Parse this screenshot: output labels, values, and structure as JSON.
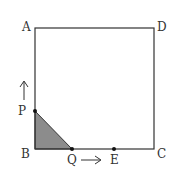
{
  "diagram": {
    "points": {
      "A": {
        "label": "A",
        "x": 35,
        "y": 28
      },
      "B": {
        "label": "B",
        "x": 35,
        "y": 149
      },
      "C": {
        "label": "C",
        "x": 154,
        "y": 149
      },
      "D": {
        "label": "D",
        "x": 154,
        "y": 28
      },
      "P": {
        "label": "P",
        "x": 35,
        "y": 111
      },
      "Q": {
        "label": "Q",
        "x": 72,
        "y": 149
      },
      "E": {
        "label": "E",
        "x": 114,
        "y": 149
      }
    },
    "shaded_region": "triangle PBQ",
    "arrows": [
      {
        "name": "P-direction",
        "direction": "up"
      },
      {
        "name": "Q-direction",
        "direction": "right"
      }
    ],
    "colors": {
      "stroke": "#333333",
      "shade": "#8c8c8c",
      "background": "#ffffff"
    }
  }
}
